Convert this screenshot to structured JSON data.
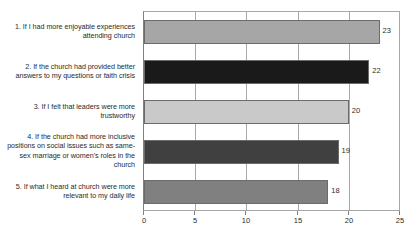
{
  "chart_data": {
    "type": "bar",
    "orientation": "horizontal",
    "title": "",
    "subtitle": "",
    "xlabel": "",
    "ylabel": "",
    "xlim": [
      0,
      25
    ],
    "xticks": [
      0,
      5,
      10,
      15,
      20,
      25
    ],
    "grid": true,
    "legend": false,
    "categories": [
      "1. If I had more enjoyable experiences attending church",
      "2. If the church had provided better answers to my questions or faith crisis",
      "3. If I felt that leaders were more trustworthy",
      "4. If the church had more inclusive positions on social issues such as same-sex marriage or women's roles in the church",
      "5. If what I heard at church were more relevant to my daily life"
    ],
    "values": [
      23,
      22,
      20,
      19,
      18
    ],
    "value_labels": [
      "23",
      "22",
      "20",
      "19",
      "18"
    ],
    "bar_colors": [
      "#a6a6a6",
      "#1a1a1a",
      "#c9c9c9",
      "#404040",
      "#808080"
    ],
    "bar_border_color": "#6b6b6b",
    "axis_color": "#a8a8a8",
    "grid_color": "#a8a8a8",
    "text_color": "#2b2b2b",
    "background_color": "#ffffff"
  }
}
